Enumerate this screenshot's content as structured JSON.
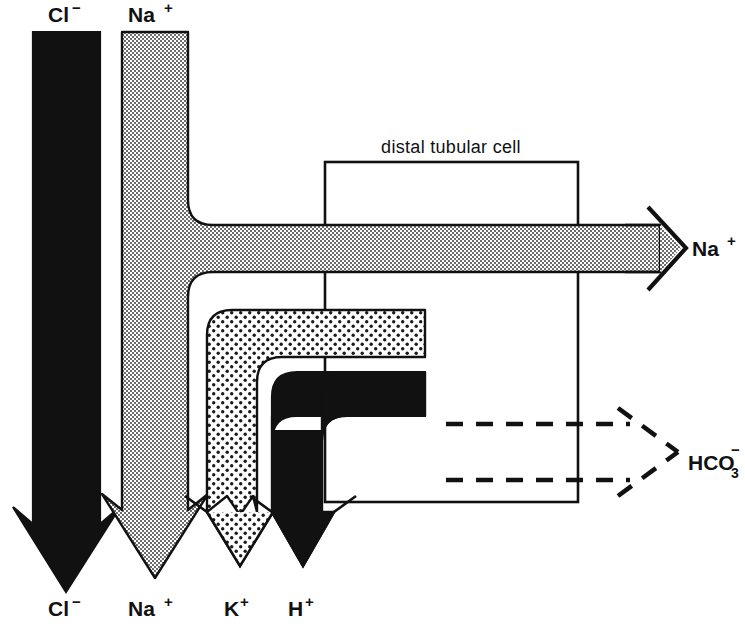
{
  "diagram": {
    "title": "distal tubular cell",
    "cell_box": {
      "label": "distal tubular cell",
      "x": 325,
      "y": 162,
      "width": 253,
      "height": 340
    },
    "colors": {
      "black": "#111111",
      "gray_fill": "#9a9a9a",
      "light_dot_fill": "#f2f2f2",
      "outline": "#111111",
      "background": "#ffffff"
    },
    "top_labels": [
      {
        "name": "chloride-top",
        "text": "Cl",
        "charge": "−",
        "x": 66,
        "y": 20
      },
      {
        "name": "sodium-top",
        "text": "Na",
        "charge": "+",
        "x": 155,
        "y": 20
      }
    ],
    "bottom_labels": [
      {
        "name": "chloride-bottom",
        "text": "Cl",
        "charge": "−",
        "x": 66,
        "y": 610
      },
      {
        "name": "sodium-bottom",
        "text": "Na",
        "charge": "+",
        "x": 155,
        "y": 610
      },
      {
        "name": "potassium-bottom",
        "text": "K",
        "charge": "+",
        "x": 240,
        "y": 610
      },
      {
        "name": "hydrogen-bottom",
        "text": "H",
        "charge": "+",
        "x": 303,
        "y": 610
      }
    ],
    "right_labels": [
      {
        "name": "sodium-right",
        "text": "Na",
        "charge": "+",
        "x": 697,
        "y": 248
      },
      {
        "name": "bicarbonate-right",
        "text": "HCO",
        "sub": "3",
        "charge": "−",
        "x": 700,
        "y": 462
      }
    ],
    "flows": [
      {
        "name": "chloride-flow",
        "ion": "Cl−",
        "fill": "solid-black",
        "direction": "down",
        "x_left": 33,
        "x_right": 100,
        "y_top": 32,
        "y_tip": 592
      },
      {
        "name": "sodium-flow",
        "ion": "Na+",
        "fill": "gray-checker",
        "direction": "down-and-right-branch",
        "x_left": 122,
        "x_right": 188,
        "y_top": 32,
        "y_tip": 578
      },
      {
        "name": "sodium-reabsorption-flow",
        "ion": "Na+",
        "fill": "gray-checker",
        "direction": "right",
        "y_top": 225,
        "y_bottom": 272,
        "x_tip": 680
      },
      {
        "name": "potassium-flow",
        "ion": "K+",
        "fill": "light-dots",
        "direction": "left-then-down",
        "x_left": 207,
        "x_right": 257,
        "y_top": 310,
        "y_bottom": 357,
        "x_end": 425,
        "y_tip": 578
      },
      {
        "name": "hydrogen-flow",
        "ion": "H+",
        "fill": "solid-black",
        "direction": "left-then-down",
        "x_left": 272,
        "x_right": 322,
        "y_top": 372,
        "y_bottom": 416,
        "x_end": 425,
        "y_tip": 578
      },
      {
        "name": "bicarbonate-flow-upper",
        "ion": "HCO3−",
        "style": "dashed",
        "direction": "right",
        "y": 424,
        "x_start": 446,
        "x_tip": 678
      },
      {
        "name": "bicarbonate-flow-lower",
        "ion": "HCO3−",
        "style": "dashed",
        "direction": "right",
        "y": 480,
        "x_start": 446,
        "x_tip": 678
      }
    ]
  }
}
